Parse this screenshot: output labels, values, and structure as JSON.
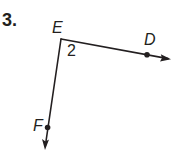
{
  "problem": {
    "number": "3."
  },
  "figure": {
    "vertex": {
      "label": "E",
      "x": 61,
      "y": 39
    },
    "angle_label": "2",
    "points": [
      {
        "label": "D",
        "x": 147,
        "y": 54
      },
      {
        "label": "F",
        "x": 47,
        "y": 127
      }
    ],
    "rays": [
      {
        "from": "E",
        "through": "D",
        "tip": [
          170,
          59
        ]
      },
      {
        "from": "E",
        "through": "F",
        "tip": [
          45,
          149
        ]
      }
    ],
    "stroke_color": "#231f20"
  }
}
